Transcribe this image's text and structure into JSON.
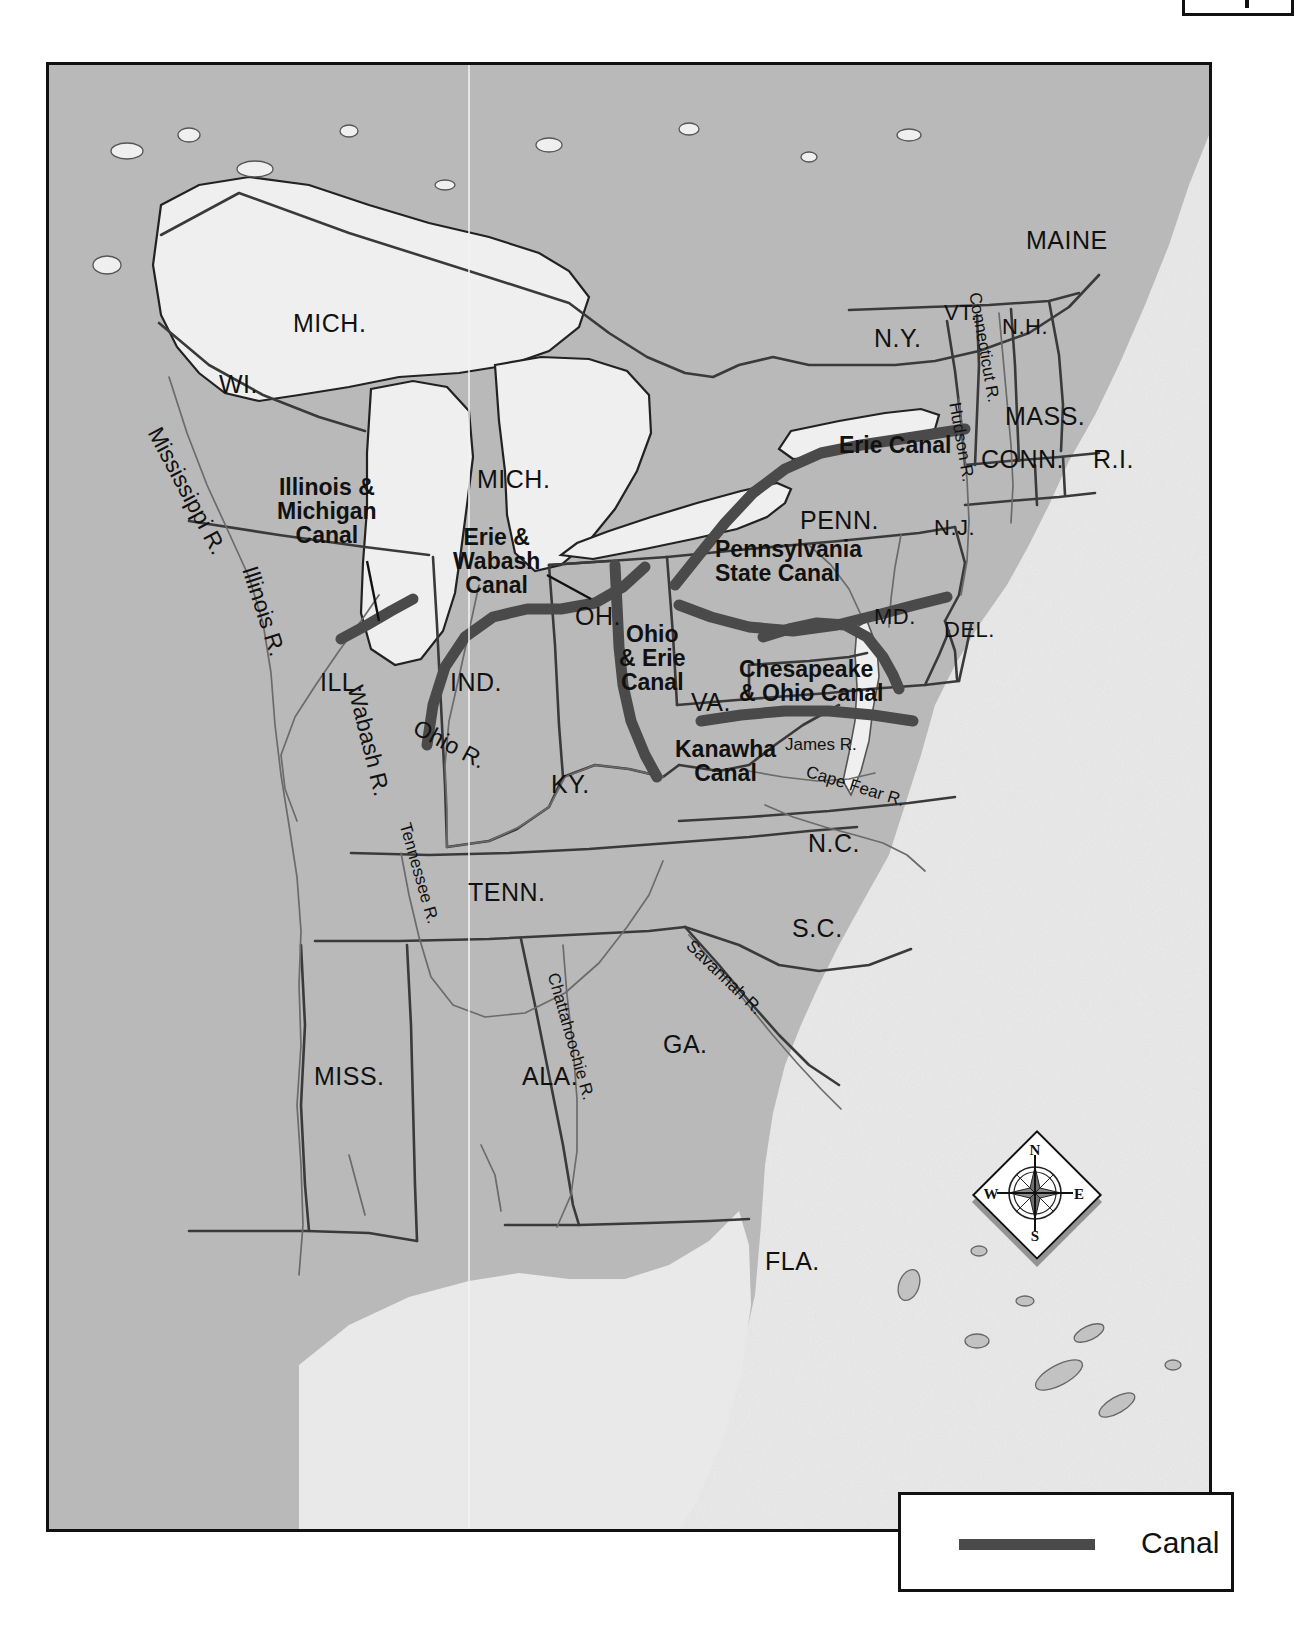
{
  "map": {
    "title": "Canals of the Eastern United States",
    "frame": {
      "x": 46,
      "y": 62,
      "w": 1166,
      "h": 1470
    },
    "colors": {
      "land": "#b9b9b9",
      "land_west": "#9a9a9a",
      "water_lake": "#ececec",
      "ocean": "#e9e9e9",
      "canal": "#4a4a4a",
      "border": "#3a3a3a",
      "outline": "#222222",
      "label": "#111111",
      "page": "#ffffff"
    }
  },
  "states": [
    {
      "id": "maine",
      "label": "MAINE",
      "x": 1023,
      "y": 224,
      "size": "state"
    },
    {
      "id": "vt",
      "label": "VT.",
      "x": 941,
      "y": 298,
      "size": "state sm"
    },
    {
      "id": "nh",
      "label": "N.H.",
      "x": 999,
      "y": 312,
      "size": "state sm"
    },
    {
      "id": "ny",
      "label": "N.Y.",
      "x": 871,
      "y": 322,
      "size": "state"
    },
    {
      "id": "mass",
      "label": "MASS.",
      "x": 1002,
      "y": 400,
      "size": "state"
    },
    {
      "id": "conn",
      "label": "CONN.",
      "x": 978,
      "y": 443,
      "size": "state"
    },
    {
      "id": "ri",
      "label": "R.I.",
      "x": 1090,
      "y": 443,
      "size": "state"
    },
    {
      "id": "mich-up",
      "label": "MICH.",
      "x": 290,
      "y": 307,
      "size": "state"
    },
    {
      "id": "wi",
      "label": "WI.",
      "x": 216,
      "y": 368,
      "size": "state"
    },
    {
      "id": "mich-lp",
      "label": "MICH.",
      "x": 474,
      "y": 463,
      "size": "state"
    },
    {
      "id": "penn",
      "label": "PENN.",
      "x": 797,
      "y": 504,
      "size": "state"
    },
    {
      "id": "nj",
      "label": "N.J.",
      "x": 931,
      "y": 513,
      "size": "state sm"
    },
    {
      "id": "oh",
      "label": "OH.",
      "x": 572,
      "y": 600,
      "size": "state"
    },
    {
      "id": "md",
      "label": "MD.",
      "x": 871,
      "y": 602,
      "size": "state sm"
    },
    {
      "id": "del",
      "label": "DEL.",
      "x": 941,
      "y": 615,
      "size": "state sm"
    },
    {
      "id": "ill",
      "label": "ILL.",
      "x": 317,
      "y": 666,
      "size": "state"
    },
    {
      "id": "ind",
      "label": "IND.",
      "x": 447,
      "y": 666,
      "size": "state"
    },
    {
      "id": "va",
      "label": "VA.",
      "x": 688,
      "y": 686,
      "size": "state"
    },
    {
      "id": "ky",
      "label": "KY.",
      "x": 548,
      "y": 768,
      "size": "state"
    },
    {
      "id": "nc",
      "label": "N.C.",
      "x": 805,
      "y": 827,
      "size": "state"
    },
    {
      "id": "tenn",
      "label": "TENN.",
      "x": 465,
      "y": 876,
      "size": "state"
    },
    {
      "id": "sc",
      "label": "S.C.",
      "x": 789,
      "y": 912,
      "size": "state"
    },
    {
      "id": "ga",
      "label": "GA.",
      "x": 660,
      "y": 1028,
      "size": "state"
    },
    {
      "id": "miss",
      "label": "MISS.",
      "x": 311,
      "y": 1060,
      "size": "state"
    },
    {
      "id": "ala",
      "label": "ALA.",
      "x": 519,
      "y": 1060,
      "size": "state"
    },
    {
      "id": "fla",
      "label": "FLA.",
      "x": 762,
      "y": 1245,
      "size": "state"
    }
  ],
  "canals": [
    {
      "id": "erie",
      "label": "Erie Canal",
      "x": 836,
      "y": 430,
      "align": "left"
    },
    {
      "id": "illinois-michigan",
      "label": "Illinois &\nMichigan\nCanal",
      "x": 283,
      "y": 482,
      "align": "center"
    },
    {
      "id": "erie-wabash",
      "label": "Erie &\nWabash\nCanal",
      "x": 450,
      "y": 530,
      "align": "center"
    },
    {
      "id": "pennsylvania-state",
      "label": "Pennsylvania\nState Canal",
      "x": 716,
      "y": 534,
      "align": "left"
    },
    {
      "id": "ohio-erie",
      "label": "Ohio\n& Erie\nCanal",
      "x": 620,
      "y": 627,
      "align": "center"
    },
    {
      "id": "chesapeake-ohio",
      "label": "Chesapeake\n& Ohio Canal",
      "x": 740,
      "y": 655,
      "align": "left"
    },
    {
      "id": "kanawha",
      "label": "Kanawha\nCanal",
      "x": 672,
      "y": 735,
      "align": "center"
    }
  ],
  "rivers": [
    {
      "id": "mississippi",
      "label": "Mississippi R.",
      "x": 168,
      "y": 420,
      "rot": 62,
      "size": "river big"
    },
    {
      "id": "illinois",
      "label": "Illinois R.",
      "x": 262,
      "y": 560,
      "rot": 72,
      "size": "river big"
    },
    {
      "id": "wabash",
      "label": "Wabash R.",
      "x": 366,
      "y": 680,
      "rot": 76,
      "size": "river big"
    },
    {
      "id": "ohio",
      "label": "Ohio R.",
      "x": 420,
      "y": 712,
      "rot": 28,
      "size": "river big"
    },
    {
      "id": "tennessee",
      "label": "Tennessee R.",
      "x": 412,
      "y": 818,
      "rot": 74,
      "size": "river"
    },
    {
      "id": "chattahoochie",
      "label": "Chattahoochie R.",
      "x": 560,
      "y": 968,
      "rot": 74,
      "size": "river"
    },
    {
      "id": "savannah",
      "label": "Savannah R.",
      "x": 694,
      "y": 934,
      "rot": 44,
      "size": "river"
    },
    {
      "id": "cape-fear",
      "label": "Cape Fear R.",
      "x": 808,
      "y": 760,
      "rot": 17,
      "size": "river"
    },
    {
      "id": "james",
      "label": "James R.",
      "x": 782,
      "y": 733,
      "rot": 0,
      "size": "river"
    },
    {
      "id": "hudson",
      "label": "Hudson R.",
      "x": 960,
      "y": 398,
      "rot": 80,
      "size": "river"
    },
    {
      "id": "connecticut",
      "label": "Connecticut R.",
      "x": 980,
      "y": 288,
      "rot": 80,
      "size": "river"
    }
  ],
  "compass": {
    "north": "N",
    "south": "S",
    "east": "E",
    "west": "W"
  },
  "legend": {
    "items": [
      {
        "id": "canal",
        "label": "Canal",
        "swatch_color": "#4a4a4a",
        "style": "thick-line"
      }
    ]
  }
}
